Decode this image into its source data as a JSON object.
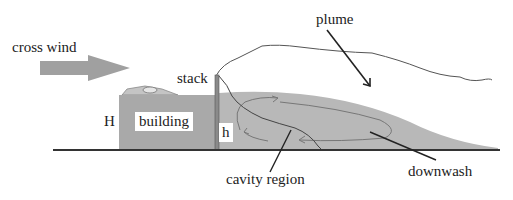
{
  "labels": {
    "cross_wind": "cross wind",
    "stack": "stack",
    "building": "building",
    "building_height": "H",
    "stack_height": "h",
    "plume": "plume",
    "cavity_region": "cavity region",
    "downwash": "downwash"
  },
  "colors": {
    "building_fill": "#a9a9a9",
    "wake_fill": "#b8b8b8",
    "arrow_fill": "#a0a0a0",
    "stack_fill": "#8a8a8a",
    "line": "#333333"
  }
}
